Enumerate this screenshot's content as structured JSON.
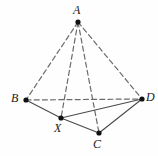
{
  "figure": {
    "background_color": "#fefefe",
    "stroke_color": "#4a4a4a",
    "dashed_stroke_color": "#6b6b6b",
    "point_color": "#111111",
    "canvas": {
      "width": 158,
      "height": 156
    }
  },
  "points": [
    {
      "id": "A",
      "label": "A",
      "x": 78,
      "y": 22,
      "label_x": 73,
      "label_y": 4
    },
    {
      "id": "B",
      "label": "B",
      "x": 26,
      "y": 100,
      "label_x": 11,
      "label_y": 92
    },
    {
      "id": "D",
      "label": "D",
      "x": 142,
      "y": 99,
      "label_x": 146,
      "label_y": 91
    },
    {
      "id": "X",
      "label": "X",
      "x": 61,
      "y": 118,
      "label_x": 54,
      "label_y": 122
    },
    {
      "id": "C",
      "label": "C",
      "x": 99,
      "y": 133,
      "label_x": 93,
      "label_y": 138
    }
  ],
  "edges": [
    {
      "id": "A-B",
      "from": "A",
      "to": "B",
      "style": "dashed"
    },
    {
      "id": "A-D",
      "from": "A",
      "to": "D",
      "style": "dashed"
    },
    {
      "id": "A-X",
      "from": "A",
      "to": "X",
      "style": "dashed"
    },
    {
      "id": "A-C",
      "from": "A",
      "to": "C",
      "style": "dashed"
    },
    {
      "id": "B-D",
      "from": "B",
      "to": "D",
      "style": "dashed"
    },
    {
      "id": "B-X",
      "from": "B",
      "to": "X",
      "style": "solid"
    },
    {
      "id": "X-C",
      "from": "X",
      "to": "C",
      "style": "solid"
    },
    {
      "id": "X-D",
      "from": "X",
      "to": "D",
      "style": "solid"
    },
    {
      "id": "C-D",
      "from": "C",
      "to": "D",
      "style": "solid"
    }
  ]
}
